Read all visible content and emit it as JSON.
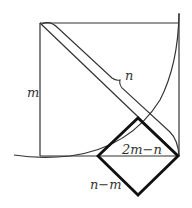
{
  "diagram": {
    "labels": {
      "side": "m",
      "diagonal_band": "n",
      "inner_square_diagonal": "2m−n",
      "inner_square_side": "n−m"
    },
    "colors": {
      "line": "#333333",
      "bold": "#111111",
      "background": "#ffffff"
    },
    "shapes": {
      "outer_square": {
        "x": 40,
        "y": 23,
        "size": 139
      },
      "inner_square_rotated": {
        "top": [
          138,
          118
        ],
        "left": [
          98,
          156
        ],
        "right": [
          178,
          156
        ],
        "bottom": [
          138,
          195
        ]
      }
    }
  }
}
